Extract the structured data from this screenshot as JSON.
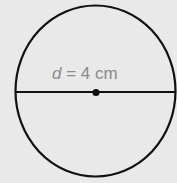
{
  "diagram": {
    "shape": "circle",
    "label": {
      "variable": "d",
      "equals": " = ",
      "value": "4",
      "unit": " cm"
    },
    "colors": {
      "background": "#e9e9e9",
      "stroke": "#111111",
      "label": "#8a8a8a"
    }
  }
}
